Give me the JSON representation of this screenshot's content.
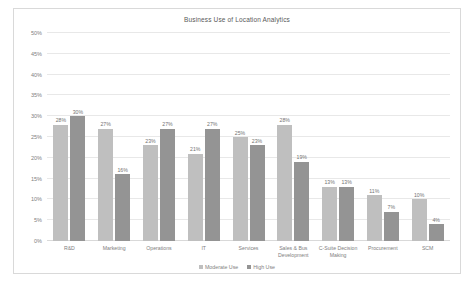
{
  "chart_data": {
    "type": "bar",
    "title": "Business Use of Location Analytics",
    "xlabel": "",
    "ylabel": "",
    "ylim": [
      0,
      50
    ],
    "y_tick_labels": [
      "0%",
      "5%",
      "10%",
      "15%",
      "20%",
      "25%",
      "30%",
      "35%",
      "40%",
      "45%",
      "50%"
    ],
    "y_tick_values": [
      0,
      5,
      10,
      15,
      20,
      25,
      30,
      35,
      40,
      45,
      50
    ],
    "grid": true,
    "legend_position": "bottom",
    "categories": [
      "R&D",
      "Marketing",
      "Operations",
      "IT",
      "Services",
      "Sales & Bus Development",
      "C-Suite Decision Making",
      "Procurement",
      "SCM"
    ],
    "series": [
      {
        "name": "Moderate Use",
        "color": "#bfbfbf",
        "values": [
          28,
          27,
          23,
          21,
          25,
          28,
          13,
          11,
          10
        ],
        "labels": [
          "28%",
          "27%",
          "23%",
          "21%",
          "25%",
          "28%",
          "13%",
          "11%",
          "10%"
        ]
      },
      {
        "name": "High Use",
        "color": "#949494",
        "values": [
          30,
          16,
          27,
          27,
          23,
          19,
          13,
          7,
          4
        ],
        "labels": [
          "30%",
          "16%",
          "27%",
          "27%",
          "23%",
          "19%",
          "13%",
          "7%",
          "4%"
        ]
      }
    ]
  }
}
